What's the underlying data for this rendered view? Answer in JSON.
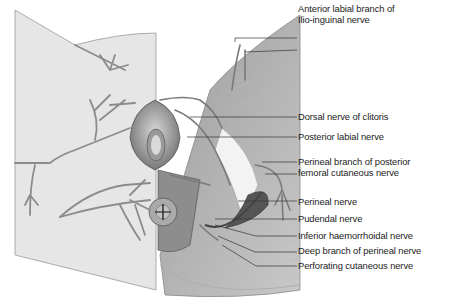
{
  "figure": {
    "labels": [
      {
        "id": "anterior-labial",
        "lines": [
          "Anterior labial branch of",
          "Ilio-inguinal nerve"
        ],
        "y": 13
      },
      {
        "id": "dorsal-clitoris",
        "lines": [
          "Dorsal nerve of clitoris"
        ],
        "y": 116
      },
      {
        "id": "posterior-labial",
        "lines": [
          "Posterior labial nerve"
        ],
        "y": 135
      },
      {
        "id": "perineal-branch-post-femoral",
        "lines": [
          "Perineal branch of posterior",
          "femoral cutaneous nerve"
        ],
        "y": 160
      },
      {
        "id": "perineal",
        "lines": [
          "Perineal nerve"
        ],
        "y": 196
      },
      {
        "id": "pudendal",
        "lines": [
          "Pudendal nerve"
        ],
        "y": 212
      },
      {
        "id": "inferior-haemorrhoidal",
        "lines": [
          "Inferior haemorrhoidal nerve"
        ],
        "y": 231
      },
      {
        "id": "deep-perineal",
        "lines": [
          "Deep branch of perineal nerve"
        ],
        "y": 246
      },
      {
        "id": "perforating-cutaneous",
        "lines": [
          "Perforating cutaneous nerve"
        ],
        "y": 261
      }
    ],
    "colors": {
      "skin": "#e4e4e4",
      "muscle": "#a9a9a9",
      "nerve": "#8c8c8c",
      "leader": "#333333",
      "text": "#222222"
    }
  }
}
